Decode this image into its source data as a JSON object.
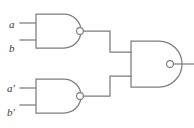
{
  "figure": {
    "background_color": "#ffffff",
    "line_color": "#7d7d7d",
    "label_color": "#3a3a3a",
    "width": 194,
    "height": 128
  },
  "labels": {
    "input_a": "a",
    "input_b": "b",
    "input_a_prime_base": "a",
    "input_a_prime_mark": "′",
    "input_b_prime_base": "b",
    "input_b_prime_mark": "′"
  },
  "gates": [
    {
      "id": "gate-top",
      "type": "NAND",
      "inputs": [
        "a",
        "b"
      ],
      "body_left": 36,
      "body_top": 14,
      "body_width": 28,
      "body_height": 34,
      "bubble_cx": 80,
      "bubble_cy": 31,
      "bubble_r": 3.4
    },
    {
      "id": "gate-bottom",
      "type": "NAND",
      "inputs": [
        "a′",
        "b′"
      ],
      "body_left": 36,
      "body_top": 79,
      "body_width": 28,
      "body_height": 34,
      "bubble_cx": 80,
      "bubble_cy": 96,
      "bubble_r": 3.4
    },
    {
      "id": "gate-output",
      "type": "NAND",
      "inputs": [
        "gate-top",
        "gate-bottom"
      ],
      "body_left": 131,
      "body_top": 41,
      "body_width": 28,
      "body_height": 46,
      "bubble_cx": 170,
      "bubble_cy": 64,
      "bubble_r": 3.4
    }
  ],
  "wires": {
    "input_a_stub": "M20,23 L36,23",
    "input_b_stub": "M20,40 L36,40",
    "input_ap_stub": "M20,88 L36,88",
    "input_bp_stub": "M20,105 L36,105",
    "top_gate_to_output": "M83.4,31 L110,31 L110,52 L131,52",
    "bottom_gate_to_output": "M83.4,96 L110,96 L110,76 L131,76",
    "output_tail": "M173.4,64 L194,64"
  }
}
